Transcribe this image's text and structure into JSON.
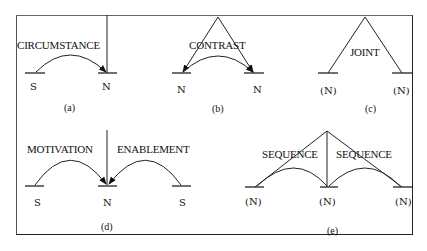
{
  "figure": {
    "panels": [
      {
        "id": "a",
        "caption": "(a)",
        "relation": "CIRCUMSTANCE",
        "nodes": [
          "S",
          "N"
        ]
      },
      {
        "id": "b",
        "caption": "(b)",
        "relation": "CONTRAST",
        "nodes": [
          "N",
          "N"
        ]
      },
      {
        "id": "c",
        "caption": "(c)",
        "relation": "JOINT",
        "nodes": [
          "(N)",
          "(N)"
        ]
      },
      {
        "id": "d",
        "caption": "(d)",
        "relations": [
          "MOTIVATION",
          "ENABLEMENT"
        ],
        "nodes": [
          "S",
          "N",
          "S"
        ]
      },
      {
        "id": "e",
        "caption": "(e)",
        "relations": [
          "SEQUENCE",
          "SEQUENCE"
        ],
        "nodes": [
          "(N)",
          "(N)",
          "(N)"
        ]
      }
    ]
  }
}
